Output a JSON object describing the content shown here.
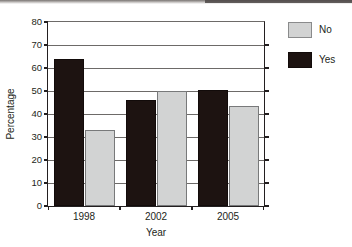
{
  "chart_data": {
    "type": "bar",
    "title": "",
    "subtitle": "",
    "xlabel": "Year",
    "ylabel": "Percentage",
    "categories": [
      "1998",
      "2002",
      "2005"
    ],
    "series": [
      {
        "name": "Yes",
        "color": "#1d1311",
        "values": [
          64,
          46,
          50.5
        ]
      },
      {
        "name": "No",
        "color": "#d2d3d3",
        "values": [
          33,
          50,
          43.5
        ]
      }
    ],
    "ylim": [
      0,
      80
    ],
    "ytick_values": [
      0,
      10,
      20,
      30,
      40,
      50,
      60,
      70,
      80
    ],
    "ytick_labels": [
      "0",
      "10",
      "20",
      "30",
      "40",
      "50",
      "60",
      "70",
      "80"
    ],
    "grid": "horizontal",
    "legend_position": "right",
    "legend_order": [
      "No",
      "Yes"
    ]
  },
  "legend": {
    "entries": [
      {
        "label": "No",
        "swatch": "legend-swatch-no"
      },
      {
        "label": "Yes",
        "swatch": "legend-swatch-yes"
      }
    ]
  },
  "axes": {
    "x_title": "Year",
    "y_title": "Percentage"
  }
}
